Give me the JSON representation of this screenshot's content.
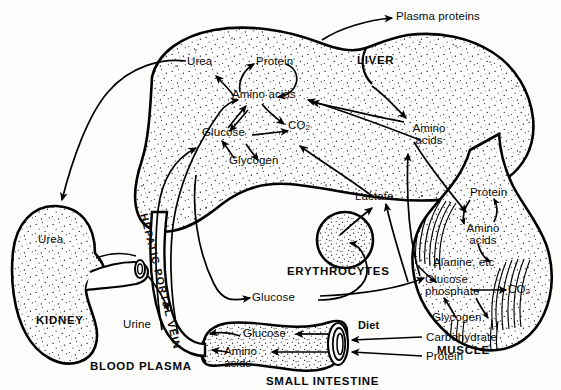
{
  "figure": {
    "ink": "#000000",
    "paper": "#fdfdfb"
  },
  "organs": {
    "liver": "LIVER",
    "kidney": "KIDNEY",
    "erythrocytes": "ERYTHROCYTES",
    "small_intestine": "SMALL INTESTINE",
    "muscle": "MUSCLE",
    "blood_plasma": "BLOOD PLASMA"
  },
  "vessel": {
    "hepatic_portal_vein": [
      "H",
      "E",
      "P",
      "A",
      "T",
      "I",
      "C",
      "P",
      "O",
      "R",
      "T",
      "A",
      "L",
      "V",
      "E",
      "I",
      "N"
    ],
    "label_text": "HEPATIC PORTAL VEIN"
  },
  "liver_metabolites": {
    "urea": "Urea",
    "protein": "Protein",
    "amino_acids": "Amino acids",
    "glucose": "Glucose",
    "glycogen": "Glycogen",
    "co2": "CO",
    "co2_sub": "2"
  },
  "kidney_metabolites": {
    "urea": "Urea",
    "urine": "Urine"
  },
  "plasma_metabolites": {
    "plasma_proteins": "Plasma proteins",
    "amino_acids_line1": "Amino",
    "amino_acids_line2": "acids",
    "lactate": "Lactate",
    "glucose": "Glucose"
  },
  "intestine_metabolites": {
    "glucose": "Glucose",
    "amino_acids_line1": "Amino",
    "amino_acids_line2": "acids"
  },
  "diet": {
    "heading": "Diet",
    "carbohydrate": "Carbohydrate",
    "protein": "Protein"
  },
  "muscle_metabolites": {
    "protein": "Protein",
    "amino_acids_line1": "Amino",
    "amino_acids_line2": "acids",
    "alanine": "Alanine, etc",
    "glucose_line1": "Glucose",
    "glucose_line2": "phosphate",
    "glycogen": "Glycogen",
    "co2": "CO",
    "co2_sub": "2"
  }
}
